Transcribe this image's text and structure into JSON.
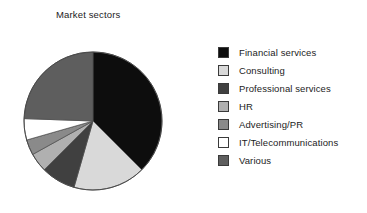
{
  "chart_data": {
    "type": "pie",
    "title": "Market sectors",
    "xlabel": "",
    "ylabel": "",
    "legend_position": "right",
    "grid": false,
    "start_angle_deg": 0,
    "direction": "clockwise",
    "categories": [
      "Financial services",
      "Consulting",
      "Professional services",
      "HR",
      "Advertising/PR",
      "IT/Telecommunications",
      "Various"
    ],
    "values": [
      37.5,
      17.0,
      8.0,
      4.5,
      3.5,
      5.0,
      24.5
    ],
    "angles_deg": [
      135,
      61,
      29,
      16,
      13,
      18,
      88
    ],
    "colors": [
      "#0d0d0d",
      "#d9d9d9",
      "#404040",
      "#b0b0b0",
      "#8a8a8a",
      "#ffffff",
      "#5e5e5e"
    ],
    "slices": [
      {
        "label": "Financial services",
        "value": 37.5,
        "color": "#0d0d0d"
      },
      {
        "label": "Consulting",
        "value": 17.0,
        "color": "#d9d9d9"
      },
      {
        "label": "Professional services",
        "value": 8.0,
        "color": "#404040"
      },
      {
        "label": "HR",
        "value": 4.5,
        "color": "#b0b0b0"
      },
      {
        "label": "Advertising/PR",
        "value": 3.5,
        "color": "#8a8a8a"
      },
      {
        "label": "IT/Telecommunications",
        "value": 5.0,
        "color": "#ffffff"
      },
      {
        "label": "Various",
        "value": 24.5,
        "color": "#5e5e5e"
      }
    ]
  },
  "chart": {
    "title": "Market sectors"
  },
  "legend": {
    "items": [
      {
        "label": "Financial services",
        "color": "#0d0d0d"
      },
      {
        "label": "Consulting",
        "color": "#d9d9d9"
      },
      {
        "label": "Professional services",
        "color": "#404040"
      },
      {
        "label": "HR",
        "color": "#b0b0b0"
      },
      {
        "label": "Advertising/PR",
        "color": "#8a8a8a"
      },
      {
        "label": "IT/Telecommunications",
        "color": "#ffffff"
      },
      {
        "label": "Various",
        "color": "#5e5e5e"
      }
    ]
  }
}
